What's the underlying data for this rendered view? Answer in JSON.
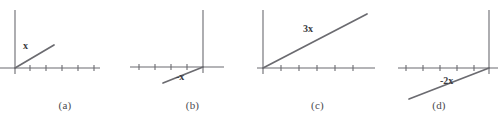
{
  "figure": {
    "stroke_color": "#6b6b70",
    "label_color": "#3c3c42",
    "background": "#ffffff"
  },
  "panels": [
    {
      "id": "a",
      "caption": "(a)",
      "vector_label": "x",
      "coefficient": "",
      "symbol": "x",
      "scalar": 1,
      "direction": "up-right",
      "origin": {
        "x": 15,
        "y": 68
      },
      "tip": {
        "x": 54,
        "y": 45
      },
      "x_axis": {
        "start_x": 0,
        "end_x": 100,
        "y": 68
      },
      "y_axis": {
        "x": 15,
        "top_y": 10,
        "bottom_y": 74
      },
      "ticks_x": [
        30,
        46,
        62,
        78,
        94
      ],
      "tick_half_height": 3
    },
    {
      "id": "b",
      "caption": "(b)",
      "vector_label": "-x",
      "coefficient": "−",
      "symbol": "x",
      "scalar": -1,
      "direction": "down-left",
      "origin": {
        "x": 73,
        "y": 67
      },
      "tip": {
        "x": 33,
        "y": 83
      },
      "x_axis": {
        "start_x": 0,
        "end_x": 94,
        "y": 67
      },
      "y_axis": {
        "x": 73,
        "top_y": 10,
        "bottom_y": 73
      },
      "ticks_x": [
        9,
        25,
        41,
        57
      ],
      "tick_half_height": 3
    },
    {
      "id": "c",
      "caption": "(c)",
      "vector_label": "3x",
      "coefficient": "3",
      "symbol": "x",
      "scalar": 3,
      "direction": "up-right",
      "origin": {
        "x": 8,
        "y": 68
      },
      "tip": {
        "x": 112,
        "y": 14
      },
      "x_axis": {
        "start_x": 2,
        "end_x": 120,
        "y": 68
      },
      "y_axis": {
        "x": 8,
        "top_y": 10,
        "bottom_y": 74
      },
      "ticks_x": [
        26,
        44,
        62,
        80,
        98
      ],
      "tick_half_height": 3
    },
    {
      "id": "d",
      "caption": "(d)",
      "vector_label": "-2x",
      "coefficient": "−2",
      "symbol": "x",
      "scalar": -2,
      "direction": "down-left",
      "origin": {
        "x": 109,
        "y": 68
      },
      "tip": {
        "x": 29,
        "y": 99
      },
      "x_axis": {
        "start_x": 18,
        "end_x": 118,
        "y": 68
      },
      "y_axis": {
        "x": 109,
        "top_y": 10,
        "bottom_y": 74
      },
      "ticks_x": [
        26,
        43,
        60,
        77,
        94
      ],
      "tick_half_height": 3
    }
  ]
}
